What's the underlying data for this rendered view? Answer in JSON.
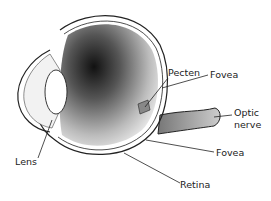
{
  "diagram": {
    "labels": {
      "pecten": "Pecten",
      "fovea_upper": "Fovea",
      "optic_nerve_line1": "Optic",
      "optic_nerve_line2": "nerve",
      "lens": "Lens",
      "fovea_lower": "Fovea",
      "retina": "Retina"
    },
    "colors": {
      "ink": "#222222",
      "background": "#ffffff"
    }
  }
}
